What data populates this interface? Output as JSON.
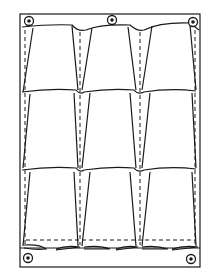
{
  "diagram": {
    "frame": {
      "x": 20,
      "y": 14,
      "width": 180,
      "height": 253
    },
    "rows": 3,
    "columns": 3,
    "grommets": [
      {
        "x": 29,
        "y": 21
      },
      {
        "x": 112,
        "y": 20
      },
      {
        "x": 193,
        "y": 22
      },
      {
        "x": 28,
        "y": 258
      },
      {
        "x": 191,
        "y": 259
      }
    ],
    "colors": {
      "stroke": "#1a1a1a",
      "background": "#ffffff"
    }
  }
}
